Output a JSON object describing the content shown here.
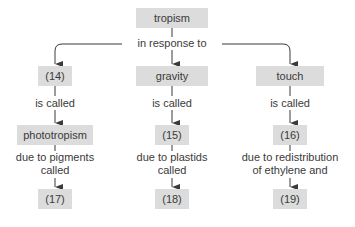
{
  "root": {
    "label": "tropism"
  },
  "root_link": "in response to",
  "columns": [
    {
      "stimulus": "(14)",
      "link1": "is called",
      "response": "phototropism",
      "link2_line1": "due to pigments",
      "link2_line2": "called",
      "mechanism": "(17)"
    },
    {
      "stimulus": "gravity",
      "link1": "is called",
      "response": "(15)",
      "link2_line1": "due to plastids",
      "link2_line2": "called",
      "mechanism": "(18)"
    },
    {
      "stimulus": "touch",
      "link1": "is called",
      "response": "(16)",
      "link2_line1": "due to redistribution",
      "link2_line2": "of ethylene and",
      "mechanism": "(19)"
    }
  ],
  "colors": {
    "box": "#dcdcdc",
    "line": "#3a3a3a",
    "text": "#3a3a3a"
  }
}
